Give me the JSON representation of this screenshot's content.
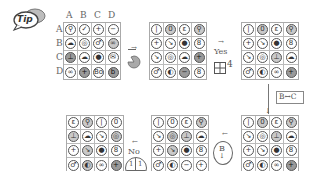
{
  "tip": {
    "label": "Tip"
  },
  "grid1": {
    "col_labels": [
      "A",
      "B",
      "C",
      "D"
    ],
    "row_labels": [
      "A",
      "B",
      "C",
      "D"
    ],
    "cells": [
      {
        "g": "⚲",
        "f": ""
      },
      {
        "g": "✓",
        "f": ""
      },
      {
        "g": "+",
        "f": ""
      },
      {
        "g": "−",
        "f": ""
      },
      {
        "g": "☁",
        "f": ""
      },
      {
        "g": "◎",
        "f": ""
      },
      {
        "g": "♂",
        "f": ""
      },
      {
        "g": "∞",
        "f": "f1"
      },
      {
        "g": "⊥",
        "f": "f2"
      },
      {
        "g": "☁",
        "f": ""
      },
      {
        "g": "●",
        "f": ""
      },
      {
        "g": "✉",
        "f": ""
      },
      {
        "g": "∞",
        "f": ""
      },
      {
        "g": "+",
        "f": "f2"
      },
      {
        "g": "Bo",
        "f": ""
      },
      {
        "g": "b",
        "f": "f2"
      }
    ]
  },
  "step1": {
    "arrow": "→",
    "icon": "rotate-icon"
  },
  "grid2": {
    "cells": [
      {
        "g": "|",
        "f": ""
      },
      {
        "g": "0",
        "f": "f1"
      },
      {
        "g": "ε",
        "f": ""
      },
      {
        "g": "⚲",
        "f": "f1"
      },
      {
        "g": "+",
        "f": ""
      },
      {
        "g": "↘",
        "f": ""
      },
      {
        "g": "●",
        "f": ""
      },
      {
        "g": "8",
        "f": ""
      },
      {
        "g": "↘",
        "f": ""
      },
      {
        "g": "◎",
        "f": ""
      },
      {
        "g": "☁",
        "f": ""
      },
      {
        "g": "+",
        "f": "f2"
      },
      {
        "g": "♂",
        "f": ""
      },
      {
        "g": "◐",
        "f": ""
      },
      {
        "g": "−",
        "f": "f2"
      },
      {
        "g": "8",
        "f": ""
      }
    ]
  },
  "step2": {
    "arrow": "→",
    "answer": "Yes",
    "quad_count": "4"
  },
  "grid3": {
    "cells": [
      {
        "g": "|",
        "f": ""
      },
      {
        "g": "0",
        "f": "f1"
      },
      {
        "g": "ε",
        "f": ""
      },
      {
        "g": "⚲",
        "f": "f1"
      },
      {
        "g": "+",
        "f": ""
      },
      {
        "g": "↘",
        "f": ""
      },
      {
        "g": "●",
        "f": ""
      },
      {
        "g": "8",
        "f": ""
      },
      {
        "g": "↘",
        "f": ""
      },
      {
        "g": "◎",
        "f": ""
      },
      {
        "g": "⊥",
        "f": "f1"
      },
      {
        "g": "☁",
        "f": ""
      },
      {
        "g": "♂",
        "f": ""
      },
      {
        "g": "◐",
        "f": ""
      },
      {
        "g": "∞",
        "f": ""
      },
      {
        "g": "+",
        "f": "f2"
      }
    ]
  },
  "step3": {
    "swap_label": "B↔C",
    "arrow": "↓"
  },
  "grid4": {
    "cells": [
      {
        "g": "|",
        "f": ""
      },
      {
        "g": "0",
        "f": "f1"
      },
      {
        "g": "ε",
        "f": ""
      },
      {
        "g": "⚲",
        "f": "f1"
      },
      {
        "g": "↘",
        "f": ""
      },
      {
        "g": "◎",
        "f": ""
      },
      {
        "g": "⊥",
        "f": "f1"
      },
      {
        "g": "☁",
        "f": ""
      },
      {
        "g": "+",
        "f": ""
      },
      {
        "g": "↘",
        "f": ""
      },
      {
        "g": "●",
        "f": ""
      },
      {
        "g": "8",
        "f": ""
      },
      {
        "g": "♂",
        "f": ""
      },
      {
        "g": "◐",
        "f": ""
      },
      {
        "g": "∞",
        "f": ""
      },
      {
        "g": "+",
        "f": "f2"
      }
    ]
  },
  "step4": {
    "arrow": "←",
    "circle_label": "B",
    "circle_arrow": "↓"
  },
  "grid5": {
    "cells": [
      {
        "g": "|",
        "f": ""
      },
      {
        "g": "0",
        "f": ""
      },
      {
        "g": "ε",
        "f": ""
      },
      {
        "g": "⚲",
        "f": "f1"
      },
      {
        "g": "↘",
        "f": ""
      },
      {
        "g": "◎",
        "f": "f1"
      },
      {
        "g": "⊥",
        "f": "f1"
      },
      {
        "g": "☁",
        "f": ""
      },
      {
        "g": "+",
        "f": ""
      },
      {
        "g": "↘",
        "f": "f1"
      },
      {
        "g": "●",
        "f": ""
      },
      {
        "g": "8",
        "f": ""
      },
      {
        "g": "♂",
        "f": ""
      },
      {
        "g": "◐",
        "f": ""
      },
      {
        "g": "−",
        "f": ""
      },
      {
        "g": "+",
        "f": ""
      }
    ]
  },
  "step5": {
    "arrow": "←",
    "answer": "No",
    "circle_left": "1",
    "circle_right": "1"
  },
  "grid6": {
    "cells": [
      {
        "g": "ε",
        "f": ""
      },
      {
        "g": "⚲",
        "f": "f1"
      },
      {
        "g": "|",
        "f": ""
      },
      {
        "g": "0",
        "f": ""
      },
      {
        "g": "⊥",
        "f": "f1"
      },
      {
        "g": "☁",
        "f": ""
      },
      {
        "g": "↘",
        "f": ""
      },
      {
        "g": "◎",
        "f": "f1"
      },
      {
        "g": "+",
        "f": ""
      },
      {
        "g": "↘",
        "f": "f1"
      },
      {
        "g": "●",
        "f": ""
      },
      {
        "g": "8",
        "f": ""
      },
      {
        "g": "♂",
        "f": ""
      },
      {
        "g": "◐",
        "f": "f1"
      },
      {
        "g": "∞",
        "f": ""
      },
      {
        "g": "+",
        "f": "f2"
      }
    ]
  }
}
